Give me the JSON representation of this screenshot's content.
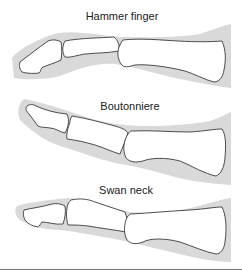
{
  "figure": {
    "panels": [
      {
        "id": "hammer-finger",
        "label": "Hammer finger"
      },
      {
        "id": "boutonniere",
        "label": "Boutonniere"
      },
      {
        "id": "swan-neck",
        "label": "Swan neck"
      }
    ],
    "colors": {
      "soft_tissue": "#d9d9d9",
      "bone_fill": "#ffffff",
      "bone_outline": "#3a3a3a",
      "text": "#1a1a1a",
      "separator": "#777777"
    }
  }
}
